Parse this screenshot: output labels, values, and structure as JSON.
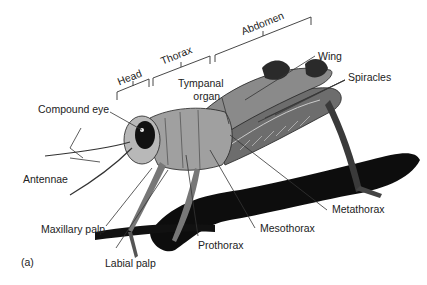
{
  "figure": {
    "panel_label": "(a)"
  },
  "regions": [
    {
      "label": "Head"
    },
    {
      "label": "Thorax"
    },
    {
      "label": "Abdomen"
    }
  ],
  "labels": {
    "compound_eye": "Compound eye",
    "antennae": "Antennae",
    "maxillary_palp": "Maxillary palp",
    "labial_palp": "Labial palp",
    "prothorax": "Prothorax",
    "mesothorax": "Mesothorax",
    "metathorax": "Metathorax",
    "tympanal_organ_line1": "Tympanal",
    "tympanal_organ_line2": "organ",
    "wing": "Wing",
    "spiracles": "Spiracles"
  },
  "colors": {
    "line": "#333333",
    "text": "#222222",
    "body_dark": "#2a2a2a",
    "body_mid": "#8a8a8a",
    "body_light": "#c8c8c8",
    "shadow": "#0d0d0d"
  }
}
